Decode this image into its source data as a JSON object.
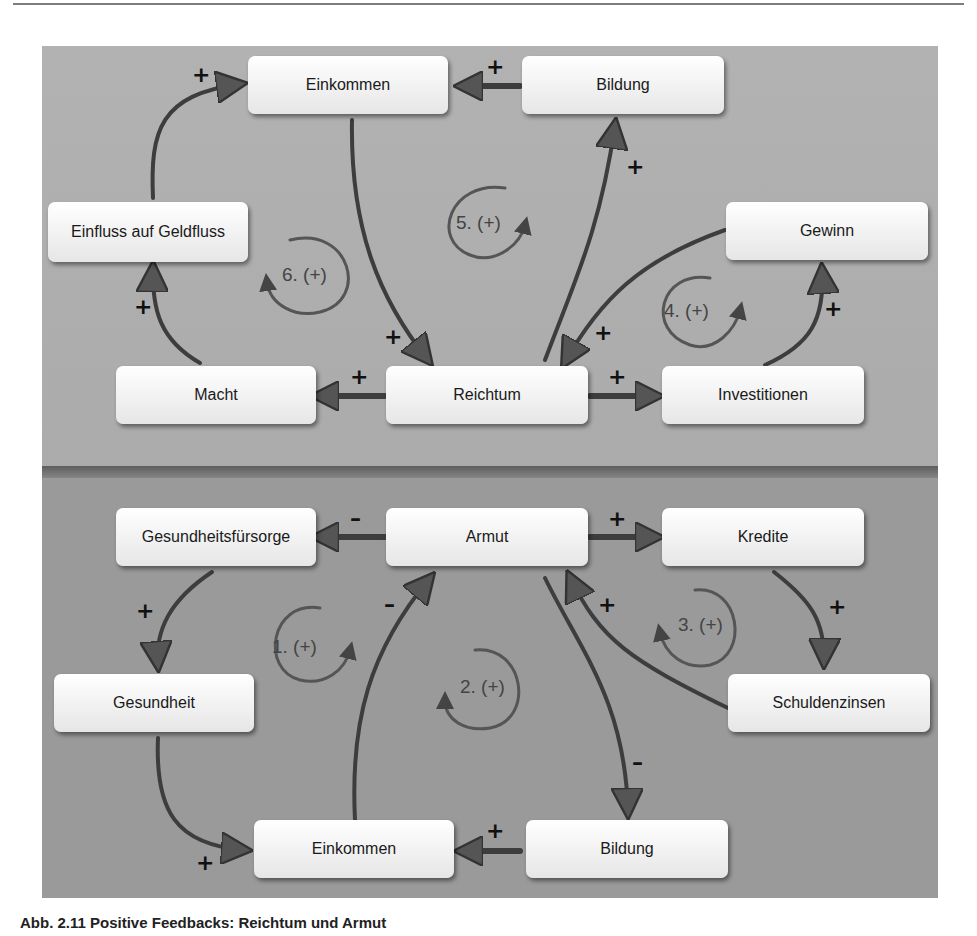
{
  "caption": "Abb. 2.11 Positive Feedbacks: Reichtum und Armut",
  "colors": {
    "panel_top": "#b0b0b0",
    "panel_bottom": "#9a9a9a",
    "arrow": "#3d3d3d",
    "node": "#f4f4f4"
  },
  "top_diagram": {
    "title": "Reichtum",
    "nodes": [
      {
        "id": "einkommen",
        "label": "Einkommen"
      },
      {
        "id": "bildung",
        "label": "Bildung"
      },
      {
        "id": "einfluss",
        "label": "Einfluss auf Geldfluss"
      },
      {
        "id": "gewinn",
        "label": "Gewinn"
      },
      {
        "id": "macht",
        "label": "Macht"
      },
      {
        "id": "reichtum",
        "label": "Reichtum"
      },
      {
        "id": "investitionen",
        "label": "Investitionen"
      }
    ],
    "edges": [
      {
        "from": "einfluss",
        "to": "einkommen",
        "sign": "+"
      },
      {
        "from": "bildung",
        "to": "einkommen",
        "sign": "+"
      },
      {
        "from": "einkommen",
        "to": "reichtum",
        "sign": "+"
      },
      {
        "from": "reichtum",
        "to": "bildung",
        "sign": "+"
      },
      {
        "from": "gewinn",
        "to": "reichtum",
        "sign": "+"
      },
      {
        "from": "investitionen",
        "to": "gewinn",
        "sign": "+"
      },
      {
        "from": "macht",
        "to": "einfluss",
        "sign": "+"
      },
      {
        "from": "reichtum",
        "to": "macht",
        "sign": "+"
      },
      {
        "from": "reichtum",
        "to": "investitionen",
        "sign": "+"
      }
    ],
    "loops": [
      "6. (+)",
      "5. (+)",
      "4. (+)"
    ]
  },
  "bottom_diagram": {
    "title": "Armut",
    "nodes": [
      {
        "id": "gesundheitsfuersorge",
        "label": "Gesundheitsfürsorge"
      },
      {
        "id": "armut",
        "label": "Armut"
      },
      {
        "id": "kredite",
        "label": "Kredite"
      },
      {
        "id": "gesundheit",
        "label": "Gesundheit"
      },
      {
        "id": "schuldenzinsen",
        "label": "Schuldenzinsen"
      },
      {
        "id": "einkommen",
        "label": "Einkommen"
      },
      {
        "id": "bildung",
        "label": "Bildung"
      }
    ],
    "edges": [
      {
        "from": "armut",
        "to": "gesundheitsfuersorge",
        "sign": "–"
      },
      {
        "from": "armut",
        "to": "kredite",
        "sign": "+"
      },
      {
        "from": "gesundheitsfuersorge",
        "to": "gesundheit",
        "sign": "+"
      },
      {
        "from": "kredite",
        "to": "schuldenzinsen",
        "sign": "+"
      },
      {
        "from": "schuldenzinsen",
        "to": "armut",
        "sign": "+"
      },
      {
        "from": "einkommen",
        "to": "armut",
        "sign": "–"
      },
      {
        "from": "armut",
        "to": "bildung",
        "sign": "–"
      },
      {
        "from": "gesundheit",
        "to": "einkommen",
        "sign": "+"
      },
      {
        "from": "bildung",
        "to": "einkommen",
        "sign": "+"
      }
    ],
    "loops": [
      "1. (+)",
      "2. (+)",
      "3. (+)"
    ]
  },
  "signs": {
    "plus": "+",
    "minus": "–"
  }
}
